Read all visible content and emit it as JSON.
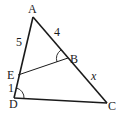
{
  "diagram": {
    "type": "geometry-triangle",
    "points": {
      "A": {
        "label": "A",
        "x": 33,
        "y": 17
      },
      "B": {
        "label": "B",
        "x": 68,
        "y": 58
      },
      "C": {
        "label": "C",
        "x": 107,
        "y": 103
      },
      "D": {
        "label": "D",
        "x": 14,
        "y": 98
      },
      "E": {
        "label": "E",
        "x": 18,
        "y": 75
      }
    },
    "segment_labels": {
      "AE": "5",
      "AB": "4",
      "BC": "x",
      "ED": "1"
    },
    "angle_marks": [
      "angle-ABE",
      "angle-ADC"
    ],
    "line_color": "#1a1a1a"
  }
}
